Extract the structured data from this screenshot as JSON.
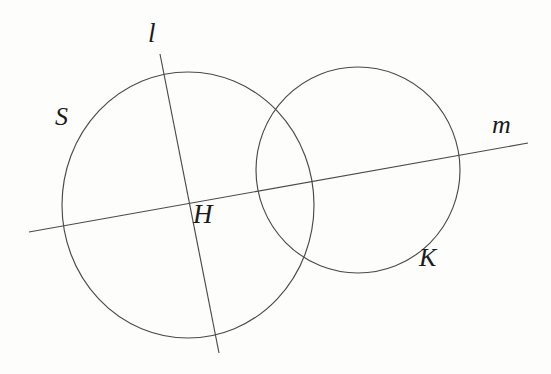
{
  "figure": {
    "background_color": "#fdfdfc",
    "stroke_color": "#4a4a4a",
    "label_color": "#1b1b1b",
    "width": 551,
    "height": 374,
    "labels": {
      "line_l": "l",
      "circle_S": "S",
      "point_H": "H",
      "line_m": "m",
      "circle_K": "K"
    },
    "shapes": {
      "circle_S": {
        "cx": 188,
        "cy": 205,
        "rx": 126,
        "ry": 133
      },
      "circle_K": {
        "cx": 358,
        "cy": 170,
        "rx": 102,
        "ry": 103
      },
      "line_l": {
        "x1": 160,
        "y1": 54,
        "x2": 219,
        "y2": 353
      },
      "line_m": {
        "x1": 29,
        "y1": 232,
        "x2": 528,
        "y2": 143
      }
    }
  }
}
